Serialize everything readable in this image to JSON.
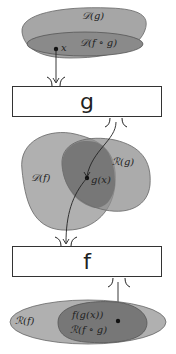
{
  "diagram": {
    "top_set": {
      "outer_label": "𝒟(g)",
      "inner_label": "𝒟(f ∘ g)",
      "point_label": "x"
    },
    "box_g": {
      "label": "g"
    },
    "middle_set": {
      "left_label": "𝒟(f)",
      "right_label": "ℛ(g)",
      "point_label": "g(x)"
    },
    "box_f": {
      "label": "f"
    },
    "bottom_set": {
      "outer_label": "ℛ(f)",
      "point_label": "f(g(x))",
      "inner_label": "ℛ(f ∘ g)"
    },
    "colors": {
      "light": "#b0b0b0",
      "medium": "#8f8f8f",
      "dark": "#707070",
      "stroke": "#333333"
    }
  }
}
